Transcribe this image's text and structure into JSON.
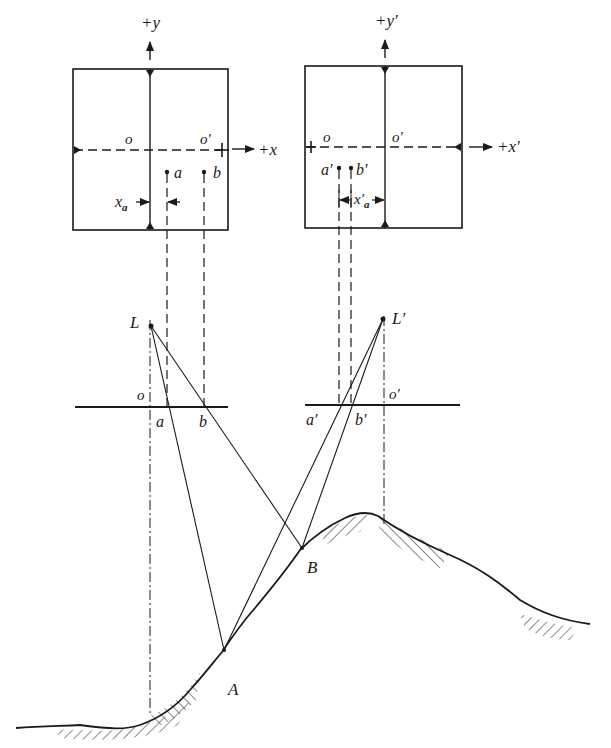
{
  "diagram": {
    "type": "stereo-photogrammetry-geometry",
    "left_photo": {
      "axis_y_label": "+y",
      "axis_x_label": "+x",
      "principal_point_label": "o",
      "conjugate_principal_point_label": "o′",
      "point_a_label": "a",
      "point_b_label": "b",
      "parallax_label_main": "x",
      "parallax_label_sub": "a"
    },
    "right_photo": {
      "axis_y_label": "+y′",
      "axis_x_label": "+x′",
      "conjugate_principal_point_label": "o",
      "principal_point_label": "o′",
      "point_a_label": "a′",
      "point_b_label": "b′",
      "parallax_label_main": "x′",
      "parallax_label_sub": "a"
    },
    "left_exposure": {
      "station_label": "L",
      "principal_point_label": "o",
      "point_a_label": "a",
      "point_b_label": "b"
    },
    "right_exposure": {
      "station_label": "L′",
      "principal_point_label": "o′",
      "point_a_label": "a′",
      "point_b_label": "b′"
    },
    "ground": {
      "point_A_label": "A",
      "point_B_label": "B"
    },
    "colors": {
      "ink": "#1a1a1a",
      "background": "#ffffff"
    }
  }
}
